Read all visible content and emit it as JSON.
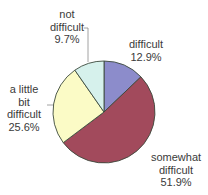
{
  "chart_data": {
    "type": "pie",
    "title": "",
    "start_angle_deg": 0,
    "direction": "clockwise",
    "center": [
      104,
      112
    ],
    "radius": 51,
    "slices": [
      {
        "name": "difficult",
        "label_lines": [
          "difficult"
        ],
        "value": 12.9,
        "value_label": "12.9%",
        "color": "#8c8ccb"
      },
      {
        "name": "somewhat difficult",
        "label_lines": [
          "somewhat",
          "difficult"
        ],
        "value": 51.9,
        "value_label": "51.9%",
        "color": "#a24a5c"
      },
      {
        "name": "a little bit difficult",
        "label_lines": [
          "a little",
          "bit",
          "difficult"
        ],
        "value": 25.6,
        "value_label": "25.6%",
        "color": "#fbfbc6"
      },
      {
        "name": "not difficult",
        "label_lines": [
          "not",
          "difficult"
        ],
        "value": 9.7,
        "value_label": "9.7%",
        "color": "#d6f1ec"
      }
    ],
    "categories": [
      "difficult",
      "somewhat difficult",
      "a little bit difficult",
      "not difficult"
    ],
    "values": [
      12.9,
      51.9,
      25.6,
      9.7
    ],
    "legend": "none (direct labels)",
    "edge_color": "#3c4a3c"
  },
  "labels": {
    "difficult": {
      "line1": "difficult",
      "pct": "12.9%"
    },
    "somewhat": {
      "line1": "somewhat",
      "line2": "difficult",
      "pct": "51.9%"
    },
    "little": {
      "line1": "a little",
      "line2": "bit",
      "line3": "difficult",
      "pct": "25.6%"
    },
    "not": {
      "line1": "not",
      "line2": "difficult",
      "pct": "9.7%"
    }
  }
}
